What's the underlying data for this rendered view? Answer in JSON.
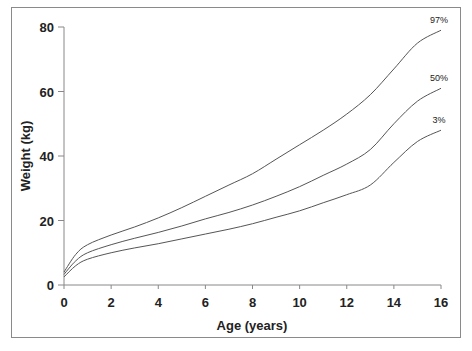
{
  "chart_data": {
    "type": "line",
    "title": "",
    "xlabel": "Age (years)",
    "ylabel": "Weight (kg)",
    "xlim": [
      0,
      16
    ],
    "ylim": [
      0,
      80
    ],
    "x_ticks": [
      0,
      2,
      4,
      6,
      8,
      10,
      12,
      14,
      16
    ],
    "y_ticks": [
      0,
      20,
      40,
      60,
      80
    ],
    "grid": false,
    "legend": "inline labels at right end of each curve",
    "x": [
      0,
      0.5,
      1,
      2,
      3,
      4,
      5,
      6,
      7,
      8,
      9,
      10,
      11,
      12,
      13,
      14,
      15,
      16
    ],
    "series": [
      {
        "name": "97%",
        "values": [
          4.0,
          9.5,
          12.5,
          15.5,
          18.0,
          20.8,
          24.0,
          27.5,
          31.0,
          34.5,
          39.0,
          43.5,
          48.0,
          53.0,
          59.0,
          67.0,
          75.0,
          79.0
        ]
      },
      {
        "name": "50%",
        "values": [
          3.3,
          7.5,
          10.0,
          12.5,
          14.5,
          16.3,
          18.3,
          20.5,
          22.5,
          24.8,
          27.5,
          30.5,
          34.0,
          37.5,
          42.0,
          50.0,
          57.0,
          61.0
        ]
      },
      {
        "name": "3%",
        "values": [
          2.5,
          6.0,
          8.0,
          10.0,
          11.5,
          12.8,
          14.3,
          15.8,
          17.3,
          19.0,
          21.0,
          23.0,
          25.5,
          28.0,
          31.0,
          38.0,
          44.5,
          48.0
        ]
      }
    ]
  },
  "axes": {
    "x_title": "Age (years)",
    "y_title": "Weight (kg)",
    "x_tick_labels": [
      "0",
      "2",
      "4",
      "6",
      "8",
      "10",
      "12",
      "14",
      "16"
    ],
    "y_tick_labels": [
      "0",
      "20",
      "40",
      "60",
      "80"
    ]
  },
  "series_labels": [
    "97%",
    "50%",
    "3%"
  ],
  "colors": {
    "line": "#555555",
    "axis": "#888888",
    "text": "#222222"
  }
}
